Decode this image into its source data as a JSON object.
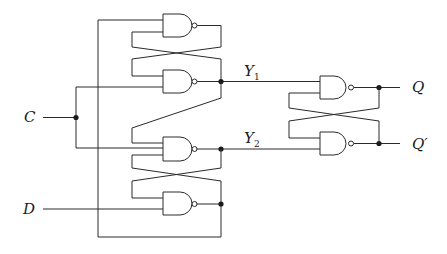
{
  "diagram": {
    "title": "",
    "type": "gated D latch (master) with NAND SR latch output stage",
    "colors": {
      "line": "#2a2a2a",
      "background": "#ffffff"
    },
    "labels": {
      "C": "C",
      "D": "D",
      "Y1_main": "Y",
      "Y1_sub": "1",
      "Y2_main": "Y",
      "Y2_sub": "2",
      "Q": "Q",
      "Qprime": "Q′"
    },
    "gates": [
      {
        "id": "g1",
        "type": "NAND",
        "position": "top-left latch, upper"
      },
      {
        "id": "g2",
        "type": "NAND",
        "position": "top-left latch, lower",
        "output": "Y1"
      },
      {
        "id": "g3",
        "type": "NAND",
        "position": "bottom-left latch, upper",
        "output": "Y2"
      },
      {
        "id": "g4",
        "type": "NAND",
        "position": "bottom-left latch, lower"
      },
      {
        "id": "g5",
        "type": "NAND",
        "position": "output latch, upper",
        "output": "Q"
      },
      {
        "id": "g6",
        "type": "NAND",
        "position": "output latch, lower",
        "output": "Q'"
      }
    ],
    "inputs": [
      "C",
      "D"
    ],
    "outputs": [
      "Q",
      "Q'"
    ]
  }
}
